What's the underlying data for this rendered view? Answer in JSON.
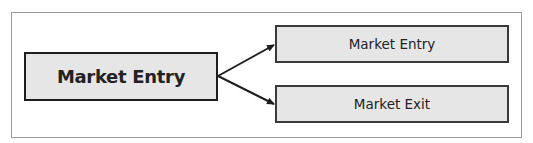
{
  "diagram": {
    "source_node": {
      "label": "Market Entry"
    },
    "target_nodes": [
      {
        "label": "Market Entry"
      },
      {
        "label": "Market Exit"
      }
    ],
    "edges": [
      {
        "from": "source_node",
        "to": "target_nodes.0",
        "type": "arrow"
      },
      {
        "from": "source_node",
        "to": "target_nodes.1",
        "type": "arrow"
      }
    ],
    "colors": {
      "box_fill": "#e6e6e6",
      "box_border": "#1e1e1e",
      "frame_border": "#9a9a9a",
      "text": "#222222"
    }
  }
}
